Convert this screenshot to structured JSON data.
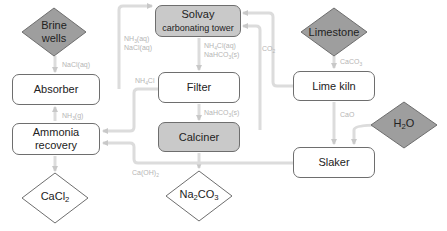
{
  "diagram": {
    "colors": {
      "arrow": "#d4d4d4",
      "label": "#b5b5b5",
      "gray_fill": "#c9c9c9",
      "border": "#6e6e6e"
    },
    "nodes": {
      "brine_wells": {
        "line1": "Brine",
        "line2": "wells",
        "shape": "diamond",
        "fill": "gray"
      },
      "absorber": {
        "label": "Absorber",
        "shape": "box"
      },
      "ammonia_recovery": {
        "line1": "Ammonia",
        "line2": "recovery",
        "shape": "box"
      },
      "cacl2": {
        "base": "CaCl",
        "sub": "2",
        "shape": "diamond"
      },
      "solvay_tower": {
        "line1": "Solvay",
        "line2": "carbonating tower",
        "shape": "box",
        "fill": "gray"
      },
      "filter": {
        "label": "Filter",
        "shape": "box"
      },
      "calciner": {
        "label": "Calciner",
        "shape": "box",
        "fill": "gray"
      },
      "na2co3": {
        "a": "Na",
        "a_sub": "2",
        "b": "CO",
        "b_sub": "3",
        "shape": "diamond"
      },
      "limestone": {
        "label": "Limestone",
        "shape": "diamond",
        "fill": "gray"
      },
      "lime_kiln": {
        "label": "Lime kiln",
        "shape": "box"
      },
      "slaker": {
        "label": "Slaker",
        "shape": "box"
      },
      "h2o": {
        "a": "H",
        "a_sub": "2",
        "b": "O",
        "shape": "diamond",
        "fill": "gray"
      }
    },
    "edges": {
      "nacl": {
        "label": "NaCl(aq)",
        "from": "Brine wells",
        "to": "Absorber"
      },
      "nh3g": {
        "a": "NH",
        "sub": "3",
        "b": "(g)",
        "from": "Ammonia recovery",
        "to": "Absorber"
      },
      "nh3aq": {
        "a": "NH",
        "sub": "3",
        "b": "(aq)",
        "from": "Absorber",
        "to": "Solvay carbonating tower"
      },
      "naclaq2": {
        "label": "NaCl(aq)"
      },
      "nh4cl_nahco3": {
        "a": "NH",
        "sub": "4",
        "b": "Cl(aq)",
        "from": "Solvay carbonating tower",
        "to": "Filter"
      },
      "nahco3_s1": {
        "a": "NaHCO",
        "sub": "3",
        "b": "(s)"
      },
      "nh4cl": {
        "a": "NH",
        "sub": "4",
        "b": "Cl",
        "from": "Filter",
        "to": "Ammonia recovery"
      },
      "nahco3_s2": {
        "a": "NaHCO",
        "sub": "3",
        "b": "(s)",
        "from": "Filter",
        "to": "Calciner"
      },
      "co2": {
        "a": "CO",
        "sub": "2",
        "from": "Lime kiln",
        "to": "Solvay carbonating tower"
      },
      "caco3": {
        "a": "CaCO",
        "sub": "3",
        "from": "Limestone",
        "to": "Lime kiln"
      },
      "cao": {
        "label": "CaO",
        "from": "Lime kiln",
        "to": "Slaker"
      },
      "caoh2": {
        "a": "Ca(OH)",
        "sub": "2",
        "from": "Slaker",
        "to": "Ammonia recovery"
      }
    }
  }
}
